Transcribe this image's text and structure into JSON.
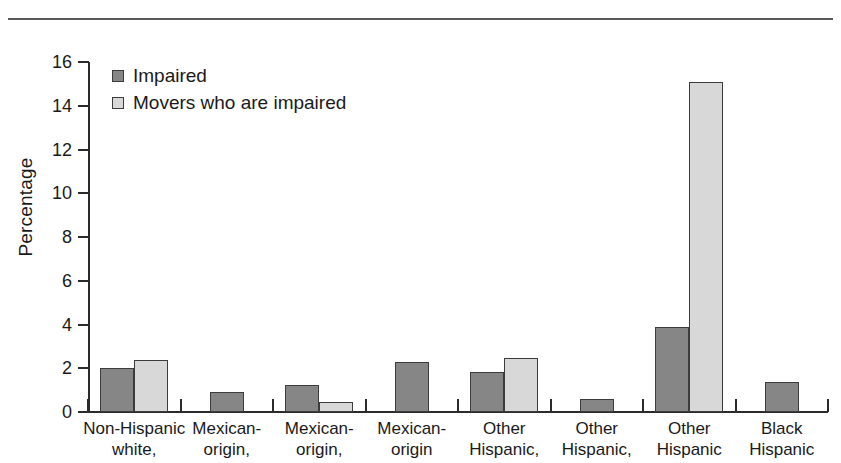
{
  "figure": {
    "divider": "top-rule"
  },
  "chart_data": {
    "type": "bar",
    "title": "",
    "xlabel": "",
    "ylabel": "Percentage",
    "ylim": [
      0,
      16
    ],
    "yticks": [
      0,
      2,
      4,
      6,
      8,
      10,
      12,
      14,
      16
    ],
    "ytick_labels": [
      "0",
      "2",
      "4",
      "6",
      "8",
      "10",
      "12",
      "14",
      "16"
    ],
    "grid": false,
    "legend_position": "upper left",
    "categories": [
      "Non-Hispanic white,",
      "Mexican-origin,",
      "Mexican-origin,",
      "Mexican-origin",
      "Other Hispanic,",
      "Other Hispanic,",
      "Other Hispanic",
      "Black Hispanic"
    ],
    "category_lines": [
      [
        "Non-Hispanic",
        "white,"
      ],
      [
        "Mexican-",
        "origin,"
      ],
      [
        "Mexican-",
        "origin,"
      ],
      [
        "Mexican-",
        "origin"
      ],
      [
        "Other",
        "Hispanic,"
      ],
      [
        "Other",
        "Hispanic,"
      ],
      [
        "Other",
        "Hispanic"
      ],
      [
        "Black",
        "Hispanic"
      ]
    ],
    "series": [
      {
        "name": "Impaired",
        "color": "#868686",
        "values": [
          2.0,
          0.9,
          1.25,
          2.3,
          1.85,
          0.6,
          3.9,
          1.35
        ]
      },
      {
        "name": "Movers who are impaired",
        "color": "#d8d8d8",
        "values": [
          2.4,
          null,
          0.45,
          null,
          2.45,
          null,
          15.1,
          null
        ]
      }
    ]
  },
  "legend": {
    "items": [
      {
        "label": "Impaired",
        "swatch": "#868686"
      },
      {
        "label": "Movers who are impaired",
        "swatch": "#d8d8d8"
      }
    ]
  }
}
